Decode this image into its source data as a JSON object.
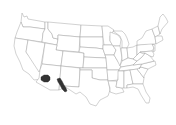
{
  "map": {
    "type": "choropleth",
    "region": "United States (contiguous states)",
    "background": "#ffffff",
    "state_fill": "#ffffff",
    "border_color": "#9a9a9a",
    "highlight_color": "#333333",
    "highlighted_areas": [
      {
        "name": "southern-arizona-area",
        "approx_location": "south-central Arizona"
      },
      {
        "name": "southern-new-mexico-west-texas-area",
        "approx_location": "southwestern New Mexico / far west Texas border"
      }
    ]
  }
}
